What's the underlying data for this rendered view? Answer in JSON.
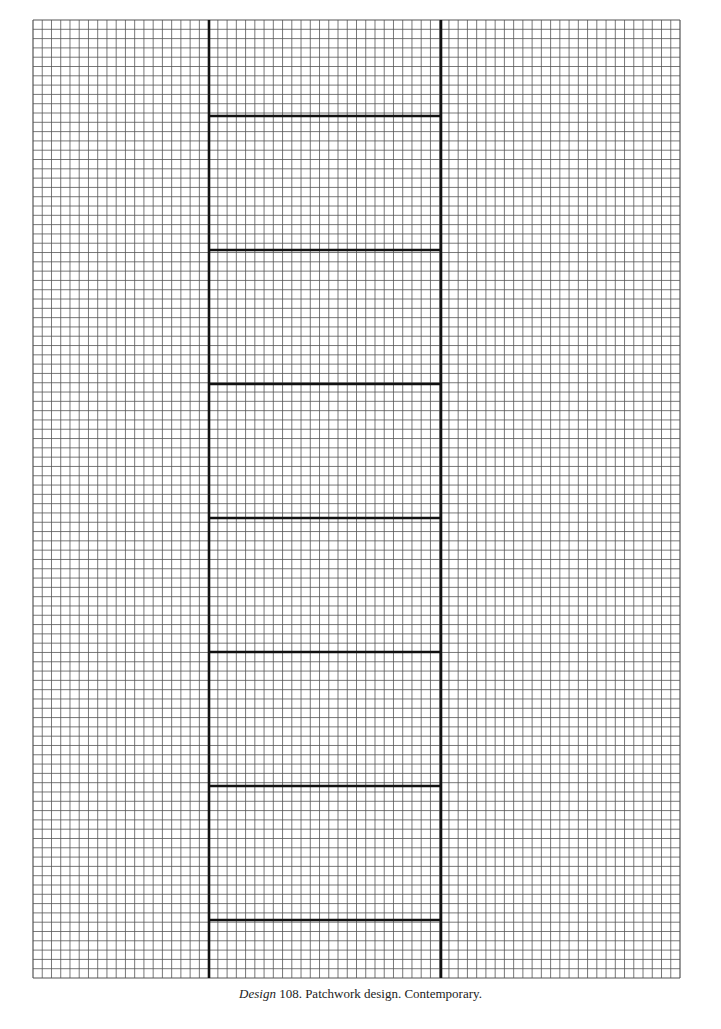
{
  "figure": {
    "grid": {
      "left": 33,
      "top": 20,
      "right": 680,
      "bottom": 978,
      "cols": 70,
      "rows": 103,
      "line_color": "#555555"
    },
    "strip": {
      "left_x": 209,
      "right_x": 441,
      "color": "#111111",
      "bars_y": [
        116,
        250,
        384,
        518,
        652,
        786,
        920
      ]
    }
  },
  "caption": {
    "label": "Design",
    "text": " 108.  Patchwork design. Contemporary."
  }
}
